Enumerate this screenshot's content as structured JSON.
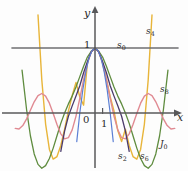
{
  "figure": {
    "kind": "math-plot",
    "axes": {
      "x_label": "x",
      "y_label": "y",
      "origin_label": "0",
      "y_tick_label": "1",
      "x_tick_label": "1",
      "axis_color": "#58585a"
    },
    "labels": {
      "s0": "s",
      "s0_sub": "0",
      "s2": "s",
      "s2_sub": "2",
      "s4": "s",
      "s4_sub": "4",
      "s6": "s",
      "s6_sub": "6",
      "s8": "s",
      "s8_sub": "8",
      "J0": "J",
      "J0_sub": "0"
    },
    "colors": {
      "s0": "#6e6e70",
      "s2": "#5b7fd4",
      "s4": "#e8b53a",
      "s6": "#4a3a6b",
      "s8": "#5f8c3f",
      "J0": "#e08a92",
      "axis": "#58585a",
      "background": "#fdfdfd"
    }
  },
  "chart_data": {
    "type": "line",
    "title": "",
    "xlabel": "x",
    "ylabel": "y",
    "xlim": [
      -11,
      11
    ],
    "ylim": [
      -1.6,
      1.75
    ],
    "grid": false,
    "legend": "inline-annotations",
    "x_ticks": [
      0,
      1
    ],
    "y_ticks": [
      0,
      1
    ],
    "annotations": [
      {
        "text": "s0",
        "x": 3.6,
        "y": 1.05
      },
      {
        "text": "s4",
        "x": 8.2,
        "y": 1.45
      },
      {
        "text": "s8",
        "x": 9.9,
        "y": 0.28
      },
      {
        "text": "J0",
        "x": 9.6,
        "y": -0.92
      },
      {
        "text": "s2",
        "x": 4.0,
        "y": -1.35
      },
      {
        "text": "s6",
        "x": 6.0,
        "y": -1.35
      }
    ],
    "series": [
      {
        "name": "s0",
        "formula": "1",
        "color": "#6e6e70",
        "x": [
          -11,
          11
        ],
        "values": [
          1,
          1
        ]
      },
      {
        "name": "s2",
        "formula": "1 - x^2/4",
        "color": "#5b7fd4",
        "x": [
          -3.3,
          -2.8,
          -2.4,
          -2.0,
          -1.6,
          -1.2,
          -0.8,
          -0.4,
          0,
          0.4,
          0.8,
          1.2,
          1.6,
          2.0,
          2.4,
          2.8,
          3.3
        ],
        "values": [
          -1.72,
          -0.96,
          -0.44,
          0.0,
          0.36,
          0.64,
          0.84,
          0.96,
          1.0,
          0.96,
          0.84,
          0.64,
          0.36,
          0.0,
          -0.44,
          -0.96,
          -1.72
        ]
      },
      {
        "name": "s4",
        "formula": "1 - x^2/4 + x^4/64",
        "color": "#e8b53a",
        "x": [
          -7.5,
          -7,
          -6.5,
          -6,
          -5.5,
          -5,
          -4.5,
          -4,
          -3.5,
          -3,
          -2.5,
          -2,
          -1.5,
          -1,
          -0.5,
          0,
          0.5,
          1,
          1.5,
          2,
          2.5,
          3,
          3.5,
          4,
          4.5,
          5,
          5.5,
          6,
          6.5,
          7,
          7.5
        ],
        "values": [
          1.51,
          0.51,
          -0.17,
          -0.56,
          -0.71,
          -0.67,
          -0.5,
          -0.25,
          0.03,
          0.27,
          0.47,
          0.25,
          0.12,
          0.77,
          0.94,
          1.0,
          0.94,
          0.77,
          0.52,
          0.25,
          0.03,
          -0.27,
          -0.44,
          -0.25,
          -0.5,
          -0.67,
          -0.71,
          -0.56,
          -0.17,
          0.51,
          1.51
        ]
      },
      {
        "name": "s6",
        "formula": "1 - x^2/4 + x^4/64 - x^6/2304",
        "color": "#4a3a6b",
        "x": [
          -5.5,
          -5,
          -4.5,
          -4,
          -3.5,
          -3,
          -2.5,
          -2,
          -1.5,
          -1,
          -0.5,
          0,
          0.5,
          1,
          1.5,
          2,
          2.5,
          3,
          3.5,
          4,
          4.5,
          5,
          5.5
        ],
        "values": [
          -1.67,
          -1.05,
          -0.59,
          -0.28,
          -0.05,
          0.11,
          0.26,
          0.42,
          0.62,
          0.79,
          0.94,
          1.0,
          0.94,
          0.79,
          0.62,
          0.42,
          0.26,
          0.11,
          -0.05,
          -0.28,
          -0.59,
          -1.05,
          -1.67
        ]
      },
      {
        "name": "s8",
        "formula": "1 - x^2/4 + x^4/64 - x^6/2304 + x^8/147456",
        "color": "#5f8c3f",
        "x": [
          -9.6,
          -9,
          -8.5,
          -8,
          -7.5,
          -7,
          -6.5,
          -6,
          -5.5,
          -5,
          -4.5,
          -4,
          -3.5,
          -3,
          -2.5,
          -2,
          -1.5,
          -1,
          -0.5,
          0,
          0.5,
          1,
          1.5,
          2,
          2.5,
          3,
          3.5,
          4,
          4.5,
          5,
          5.5,
          6,
          6.5,
          7,
          7.5,
          8,
          8.5,
          9,
          9.6
        ],
        "values": [
          0.66,
          0.05,
          -0.35,
          -0.63,
          -0.79,
          -0.85,
          -0.81,
          -0.7,
          -0.54,
          -0.35,
          -0.16,
          0.0,
          0.14,
          0.26,
          0.4,
          0.56,
          0.72,
          0.86,
          0.95,
          1.0,
          0.95,
          0.86,
          0.72,
          0.56,
          0.4,
          0.26,
          0.14,
          0.0,
          -0.16,
          -0.35,
          -0.54,
          -0.7,
          -0.81,
          -0.85,
          -0.79,
          -0.63,
          -0.35,
          0.05,
          0.66
        ]
      },
      {
        "name": "J0",
        "formula": "BesselJ(0, x)",
        "color": "#e08a92",
        "x": [
          -10.5,
          -10,
          -9.5,
          -9,
          -8.5,
          -8,
          -7.5,
          -7,
          -6.5,
          -6,
          -5.5,
          -5,
          -4.5,
          -4,
          -3.5,
          -3,
          -2.5,
          -2,
          -1.5,
          -1,
          -0.5,
          0,
          0.5,
          1,
          1.5,
          2,
          2.5,
          3,
          3.5,
          4,
          4.5,
          5,
          5.5,
          6,
          6.5,
          7,
          7.5,
          8,
          8.5,
          9,
          9.5,
          10,
          10.5
        ],
        "values": [
          -0.237,
          -0.246,
          -0.193,
          -0.09,
          0.042,
          0.172,
          0.266,
          0.3,
          0.26,
          0.151,
          -0.007,
          -0.178,
          -0.321,
          -0.397,
          -0.38,
          -0.26,
          -0.048,
          0.224,
          0.512,
          0.765,
          0.938,
          1.0,
          0.938,
          0.765,
          0.512,
          0.224,
          -0.048,
          -0.26,
          -0.38,
          -0.397,
          -0.321,
          -0.178,
          -0.007,
          0.151,
          0.26,
          0.3,
          0.266,
          0.172,
          0.042,
          -0.09,
          -0.193,
          -0.246,
          -0.237
        ]
      }
    ]
  }
}
